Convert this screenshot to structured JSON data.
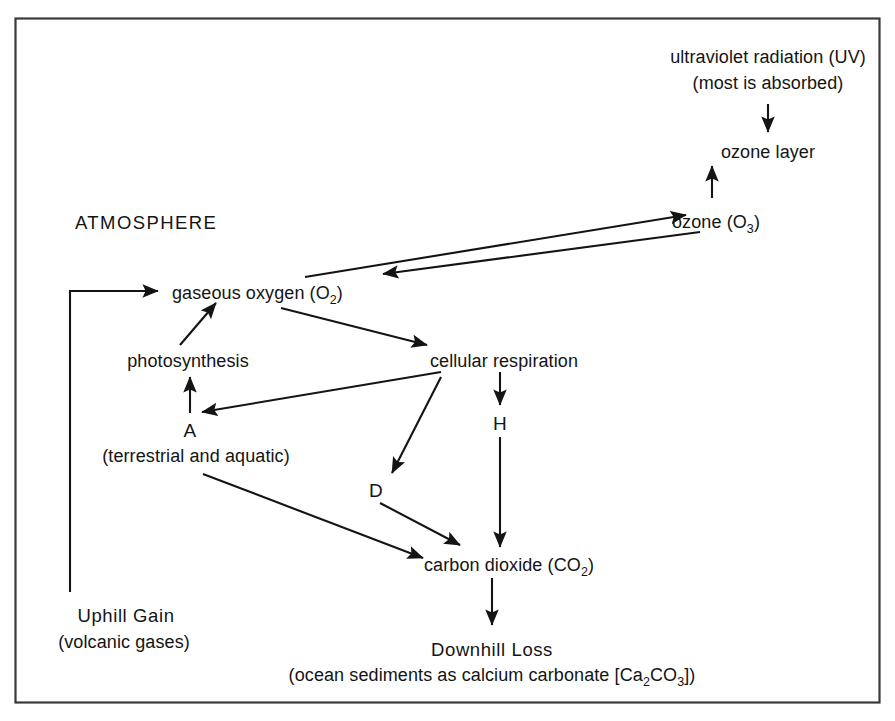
{
  "diagram": {
    "frame": {
      "stroke_color": "#3a3a3a"
    },
    "line_color": "#141414",
    "background_color": "#ffffff",
    "region_label": "ATMOSPHERE",
    "nodes": {
      "uv_radiation_line1": "ultraviolet radiation (UV)",
      "uv_radiation_line2": "(most is absorbed)",
      "ozone_layer": "ozone layer",
      "ozone_main": "ozone (O",
      "ozone_sub": "3",
      "ozone_close": ")",
      "gaseous_oxygen_main": "gaseous oxygen (O",
      "gaseous_oxygen_sub": "2",
      "gaseous_oxygen_close": ")",
      "photosynthesis": "photosynthesis",
      "cellular_respiration": "cellular respiration",
      "node_a": "A",
      "node_a_caption": "(terrestrial and aquatic)",
      "node_d": "D",
      "node_h": "H",
      "carbon_dioxide_main": "carbon dioxide (CO",
      "carbon_dioxide_sub": "2",
      "carbon_dioxide_close": ")",
      "uphill_gain": "Uphill Gain",
      "uphill_gain_caption": "(volcanic gases)",
      "downhill_loss": "Downhill Loss",
      "downhill_loss_caption_pre": "(ocean sediments as calcium carbonate [Ca",
      "downhill_loss_caption_sub1": "2",
      "downhill_loss_caption_mid": "CO",
      "downhill_loss_caption_sub2": "3",
      "downhill_loss_caption_post": "])"
    },
    "edges": [
      {
        "name": "uv-to-ozone-layer",
        "from": "ultraviolet radiation (UV)",
        "to": "ozone layer",
        "direction": "down"
      },
      {
        "name": "ozone-to-ozone-layer",
        "from": "ozone (O3)",
        "to": "ozone layer",
        "direction": "up"
      },
      {
        "name": "oxygen-to-ozone",
        "from": "gaseous oxygen (O2)",
        "to": "ozone (O3)",
        "direction": "up-right"
      },
      {
        "name": "ozone-to-oxygen",
        "from": "ozone (O3)",
        "to": "gaseous oxygen (O2)",
        "direction": "down-left"
      },
      {
        "name": "oxygen-to-cellular-respiration",
        "from": "gaseous oxygen (O2)",
        "to": "cellular respiration",
        "direction": "down-right"
      },
      {
        "name": "photosynthesis-to-oxygen",
        "from": "photosynthesis",
        "to": "gaseous oxygen (O2)",
        "direction": "up-right"
      },
      {
        "name": "a-to-photosynthesis",
        "from": "A",
        "to": "photosynthesis",
        "direction": "up"
      },
      {
        "name": "cellular-respiration-to-a",
        "from": "cellular respiration",
        "to": "A",
        "direction": "down-left"
      },
      {
        "name": "cellular-respiration-to-d",
        "from": "cellular respiration",
        "to": "D",
        "direction": "down-left"
      },
      {
        "name": "cellular-respiration-to-h",
        "from": "cellular respiration",
        "to": "H",
        "direction": "down"
      },
      {
        "name": "h-to-carbon-dioxide",
        "from": "H",
        "to": "carbon dioxide (CO2)",
        "direction": "down"
      },
      {
        "name": "d-to-carbon-dioxide",
        "from": "D",
        "to": "carbon dioxide (CO2)",
        "direction": "down-right"
      },
      {
        "name": "a-to-carbon-dioxide",
        "from": "(terrestrial and aquatic)",
        "to": "carbon dioxide (CO2)",
        "direction": "down-right"
      },
      {
        "name": "carbon-dioxide-to-downhill-loss",
        "from": "carbon dioxide (CO2)",
        "to": "Downhill Loss",
        "direction": "down"
      },
      {
        "name": "uphill-gain-to-oxygen",
        "from": "Uphill Gain",
        "to": "gaseous oxygen (O2)",
        "direction": "up-then-right"
      }
    ]
  }
}
